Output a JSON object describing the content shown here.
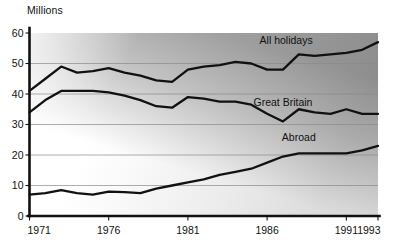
{
  "chart_data": {
    "type": "line",
    "title": "",
    "ylabel": "Millions",
    "xlabel": "",
    "ylim": [
      0,
      60
    ],
    "xlim": [
      1971,
      1993
    ],
    "grid": true,
    "legend_position": "inline-right",
    "y_ticks": [
      "0",
      "10",
      "20",
      "30",
      "40",
      "50",
      "60"
    ],
    "y_tick_values": [
      0,
      10,
      20,
      30,
      40,
      50,
      60
    ],
    "x_ticks": [
      "1971",
      "1976",
      "1981",
      "1986",
      "1991",
      "1993"
    ],
    "x_tick_values": [
      1971,
      1976,
      1981,
      1986,
      1991,
      1993
    ],
    "x": [
      1971,
      1972,
      1973,
      1974,
      1975,
      1976,
      1977,
      1978,
      1979,
      1980,
      1981,
      1982,
      1983,
      1984,
      1985,
      1986,
      1987,
      1988,
      1989,
      1990,
      1991,
      1992,
      1993
    ],
    "series": [
      {
        "name": "All holidays",
        "label": "All holidays",
        "label_x": 1987.2,
        "label_y": 56.5,
        "values": [
          41,
          45,
          49,
          47,
          47.5,
          48.5,
          47,
          46,
          44.5,
          44,
          48,
          49,
          49.5,
          50.5,
          50,
          48,
          48,
          53,
          52.5,
          53,
          53.5,
          54.5,
          57
        ]
      },
      {
        "name": "Great Britain",
        "label": "Great Britain",
        "label_x": 1987.0,
        "label_y": 36.0,
        "values": [
          34,
          38,
          41,
          41,
          41,
          40.5,
          39.5,
          38,
          36,
          35.5,
          39,
          38.5,
          37.5,
          37.5,
          36.5,
          33.5,
          31,
          35,
          34,
          33.5,
          35,
          33.5,
          33.5
        ]
      },
      {
        "name": "Abroad",
        "label": "Abroad",
        "label_x": 1988.0,
        "label_y": 24.5,
        "values": [
          7,
          7.5,
          8.5,
          7.5,
          7,
          8,
          7.8,
          7.5,
          9,
          10,
          11,
          12,
          13.5,
          14.5,
          15.5,
          17.5,
          19.5,
          20.5,
          20.5,
          20.5,
          20.5,
          21.5,
          23
        ]
      }
    ]
  }
}
